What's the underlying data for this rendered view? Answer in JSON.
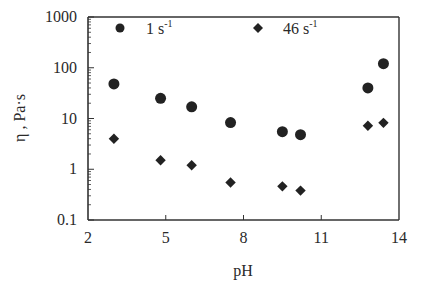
{
  "chart_data": {
    "type": "scatter",
    "title": "",
    "xlabel": "pH",
    "ylabel": "η , Pa·s",
    "xscale": "linear",
    "yscale": "log",
    "xlim": [
      2,
      14
    ],
    "ylim": [
      0.1,
      1000
    ],
    "xticks": [
      2,
      5,
      8,
      11,
      14
    ],
    "xtick_labels": [
      "2",
      "5",
      "8",
      "11",
      "14"
    ],
    "yticks": [
      0.1,
      1,
      10,
      100,
      1000
    ],
    "ytick_labels": [
      "0.1",
      "1",
      "10",
      "100",
      "1000"
    ],
    "grid": false,
    "legend_position": "top",
    "colors": {
      "ink": "#222222",
      "axis": "#333333"
    },
    "series": [
      {
        "name": "1 s-1",
        "label_main": "1 s",
        "label_sup": "-1",
        "marker": "circle",
        "x": [
          3.0,
          4.8,
          6.0,
          7.5,
          9.5,
          10.2,
          12.8,
          13.4
        ],
        "y": [
          48,
          25,
          17,
          8.3,
          5.5,
          4.8,
          40,
          120
        ]
      },
      {
        "name": "46 s-1",
        "label_main": "46 s",
        "label_sup": "-1",
        "marker": "diamond",
        "x": [
          3.0,
          4.8,
          6.0,
          7.5,
          9.5,
          10.2,
          12.8,
          13.4
        ],
        "y": [
          4.0,
          1.5,
          1.2,
          0.55,
          0.46,
          0.38,
          7.2,
          8.2
        ]
      }
    ]
  }
}
